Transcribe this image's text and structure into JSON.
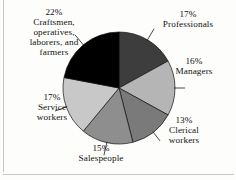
{
  "figure": {
    "type": "pie-chart",
    "background_color": "#fdfdfb",
    "border_color": "#c9c7c2"
  },
  "chart_data": {
    "type": "pie",
    "title": "",
    "subtitle": "",
    "xlabel": "",
    "ylabel": "",
    "legend_position": "none",
    "grid": false,
    "start_angle_deg": 0,
    "direction": "clockwise",
    "units": "percent",
    "categories": [
      "Professionals",
      "Managers",
      "Clerical workers",
      "Salespeople",
      "Service workers",
      "Craftsmen, operatives, laborers, and farmers"
    ],
    "values": [
      17,
      16,
      13,
      15,
      17,
      22
    ],
    "colors": [
      "#3d3d3d",
      "#b5b5b5",
      "#7a7a7a",
      "#8e8e8e",
      "#c8c8c8",
      "#000000"
    ],
    "slices": [
      {
        "name": "Professionals",
        "value": 17,
        "pct_label": "17%",
        "name_lines": [
          "Professionals"
        ],
        "color": "#3d3d3d",
        "leader_line": true
      },
      {
        "name": "Managers",
        "value": 16,
        "pct_label": "16%",
        "name_lines": [
          "Managers"
        ],
        "color": "#b5b5b5",
        "leader_line": true
      },
      {
        "name": "Clerical workers",
        "value": 13,
        "pct_label": "13%",
        "name_lines": [
          "Clerical",
          "workers"
        ],
        "color": "#7a7a7a",
        "leader_line": true
      },
      {
        "name": "Salespeople",
        "value": 15,
        "pct_label": "15%",
        "name_lines": [
          "Salespeople"
        ],
        "color": "#8e8e8e",
        "leader_line": true
      },
      {
        "name": "Service workers",
        "value": 17,
        "pct_label": "17%",
        "name_lines": [
          "Service",
          "workers"
        ],
        "color": "#c8c8c8",
        "leader_line": true
      },
      {
        "name": "Craftsmen, operatives, laborers, and farmers",
        "value": 22,
        "pct_label": "22%",
        "name_lines": [
          "Craftsmen,",
          "operatives,",
          "laborers, and",
          "farmers"
        ],
        "color": "#000000",
        "leader_line": true
      }
    ]
  },
  "labels": {
    "professionals": {
      "pct": "17%",
      "name": "Professionals"
    },
    "managers": {
      "pct": "16%",
      "name": "Managers"
    },
    "clerical": {
      "pct": "13%",
      "line1": "Clerical",
      "line2": "workers"
    },
    "salespeople": {
      "pct": "15%",
      "name": "Salespeople"
    },
    "service": {
      "pct": "17%",
      "line1": "Service",
      "line2": "workers"
    },
    "craftsmen": {
      "pct": "22%",
      "line1": "Craftsmen,",
      "line2": "operatives,",
      "line3": "laborers, and",
      "line4": "farmers"
    }
  }
}
